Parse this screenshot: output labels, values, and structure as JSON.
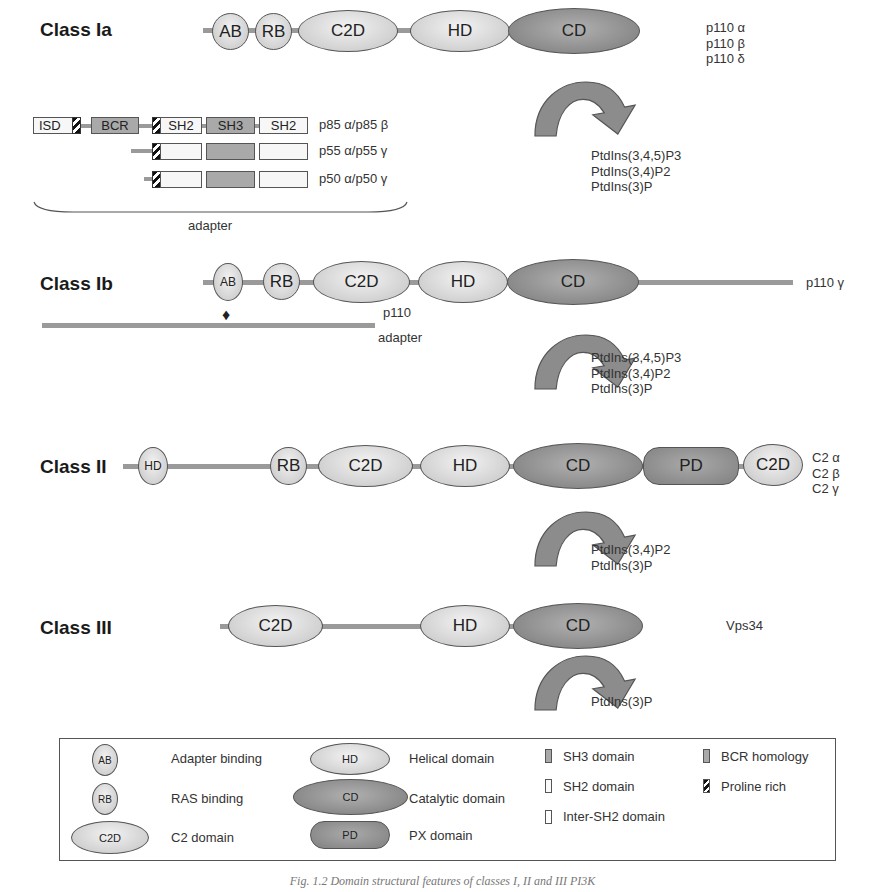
{
  "classes": [
    {
      "name": "Class Ia",
      "isoforms": [
        "p110 α",
        "p110 β",
        "p110 δ"
      ],
      "products": [
        "PtdIns(3,4,5)P3",
        "PtdIns(3,4)P2",
        "PtdIns(3)P"
      ]
    },
    {
      "name": "Class Ib",
      "isoforms": [
        "p110 γ"
      ],
      "products": [
        "PtdIns(3,4,5)P3",
        "PtdIns(3,4)P2",
        "PtdIns(3)P"
      ],
      "p110_label": "p110",
      "adapter_label": "adapter"
    },
    {
      "name": "Class II",
      "isoforms": [
        "C2 α",
        "C2 β",
        "C2 γ"
      ],
      "products": [
        "PtdIns(3,4)P2",
        "PtdIns(3)P"
      ]
    },
    {
      "name": "Class III",
      "isoforms": [
        "Vps34"
      ],
      "products": [
        "PtdIns(3)P"
      ]
    }
  ],
  "domains": {
    "AB": "AB",
    "RB": "RB",
    "C2D": "C2D",
    "HD": "HD",
    "CD": "CD",
    "PD": "PD"
  },
  "adapters": {
    "rows": [
      {
        "label": "p85 α/p85 β",
        "boxes": [
          "ISD",
          "BCR",
          "SH2",
          "SH3",
          "SH2"
        ]
      },
      {
        "label": "p55 α/p55 γ"
      },
      {
        "label": "p50 α/p50 γ"
      }
    ],
    "brace_label": "adapter"
  },
  "legend": {
    "items": [
      {
        "symbol": "AB",
        "label": "Adapter binding"
      },
      {
        "symbol": "RB",
        "label": "RAS binding"
      },
      {
        "symbol": "C2D",
        "label": "C2 domain"
      },
      {
        "symbol": "HD",
        "label": "Helical domain"
      },
      {
        "symbol": "CD",
        "label": "Catalytic domain"
      },
      {
        "symbol": "PD",
        "label": "PX domain"
      },
      {
        "label": "SH3 domain"
      },
      {
        "label": "SH2 domain"
      },
      {
        "label": "Inter-SH2 domain"
      },
      {
        "label": "BCR homology"
      },
      {
        "label": "Proline rich"
      }
    ]
  },
  "caption": "Fig. 1.2 Domain structural features of classes I, II and III PI3K"
}
